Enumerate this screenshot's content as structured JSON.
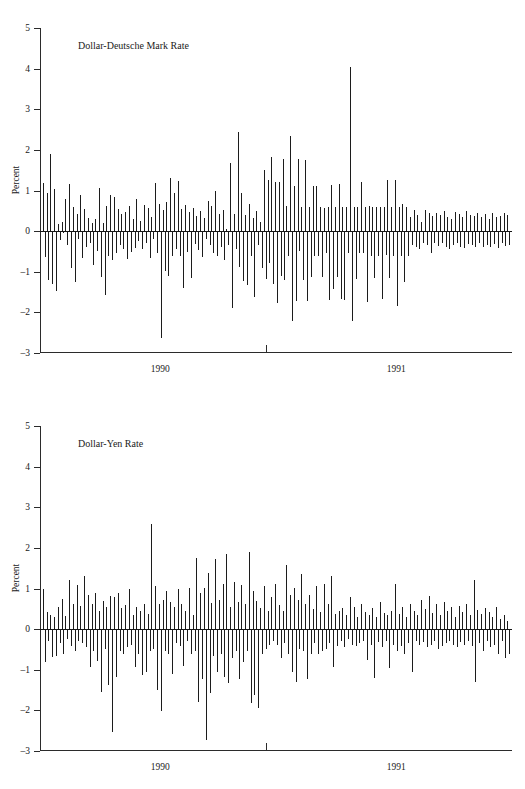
{
  "figure": {
    "width": 525,
    "height": 789,
    "background": "#ffffff",
    "ink_color": "#1c1c1c"
  },
  "chart_data": [
    {
      "type": "bar",
      "subtype": "spike",
      "title": "Dollar-Deutsche Mark Rate",
      "xlabel": "",
      "ylabel": "Percent",
      "ylim": [
        -3,
        5
      ],
      "yticks": [
        5,
        4,
        3,
        2,
        1,
        0,
        -1,
        -2,
        -3
      ],
      "ytick_labels": [
        "5",
        "4",
        "3",
        "2",
        "1",
        "0",
        "–1",
        "–2",
        "–3"
      ],
      "xtick_labels": [
        "1990",
        "1991"
      ],
      "xtick_label_positions": [
        0.255,
        0.755
      ],
      "xtick_marks": [
        0.4788
      ],
      "grid": false,
      "legend": null,
      "zero_line": true,
      "n_points": 250,
      "values": [
        1.19,
        -0.63,
        0.93,
        -1.21,
        1.89,
        -1.31,
        1.03,
        -1.48,
        0.18,
        -0.22,
        0.23,
        -0.05,
        0.78,
        -0.35,
        1.17,
        -0.9,
        0.6,
        -1.25,
        0.42,
        -0.2,
        0.9,
        -0.67,
        0.55,
        -0.4,
        0.33,
        -0.28,
        0.2,
        -0.83,
        0.31,
        -0.5,
        1.05,
        -1.12,
        0.2,
        -1.56,
        0.62,
        -0.62,
        0.88,
        -0.72,
        0.85,
        -0.55,
        0.55,
        -0.35,
        0.41,
        -0.43,
        0.48,
        -0.68,
        0.62,
        -0.52,
        0.3,
        -0.42,
        0.78,
        -0.24,
        0.25,
        -0.44,
        0.65,
        -0.3,
        0.58,
        -0.67,
        0.35,
        -0.2,
        1.19,
        -0.55,
        0.68,
        -2.62,
        0.52,
        -0.98,
        0.72,
        -1.1,
        1.3,
        -0.6,
        0.95,
        -0.43,
        1.24,
        -0.6,
        0.55,
        -1.4,
        0.65,
        -0.52,
        0.46,
        -1.16,
        0.58,
        -0.32,
        0.37,
        -0.46,
        0.5,
        -0.63,
        0.32,
        -0.2,
        0.75,
        -0.35,
        0.62,
        -0.53,
        1.0,
        -0.62,
        0.43,
        -0.38,
        0.52,
        -0.72,
        0.06,
        -0.33,
        1.67,
        -1.9,
        0.42,
        -0.45,
        2.43,
        -0.88,
        0.94,
        -1.22,
        0.4,
        -1.32,
        0.67,
        -0.6,
        0.33,
        -1.62,
        0.5,
        -0.35,
        0.22,
        -0.9,
        1.5,
        -1.18,
        1.27,
        -0.78,
        1.82,
        -1.3,
        1.2,
        -1.78,
        1.22,
        -1.1,
        1.78,
        -1.2,
        0.62,
        -0.6,
        2.35,
        -2.2,
        1.12,
        -1.72,
        1.78,
        -0.5,
        0.6,
        -1.2,
        1.75,
        -1.72,
        0.6,
        -1.13,
        1.1,
        -0.62,
        1.12,
        -0.6,
        0.6,
        -1.12,
        0.56,
        -0.55,
        0.6,
        -1.7,
        1.13,
        -1.42,
        0.6,
        -1.12,
        1.15,
        -1.68,
        0.6,
        -1.7,
        0.6,
        -0.55,
        4.05,
        -2.2,
        0.6,
        -1.18,
        0.6,
        -0.55,
        1.22,
        -0.55,
        0.6,
        -1.75,
        0.62,
        -0.6,
        0.6,
        -1.15,
        0.6,
        -0.62,
        0.6,
        -1.68,
        0.6,
        -0.58,
        1.25,
        -1.15,
        0.6,
        -0.62,
        1.26,
        -1.85,
        0.6,
        -0.6,
        0.68,
        -1.25,
        0.6,
        -0.6,
        0.35,
        -0.35,
        0.52,
        -0.4,
        0.4,
        -0.45,
        0.22,
        -0.3,
        0.52,
        -0.35,
        0.45,
        -0.55,
        0.38,
        -0.28,
        0.44,
        -0.36,
        0.4,
        -0.3,
        0.5,
        -0.4,
        0.35,
        -0.45,
        0.3,
        -0.35,
        0.48,
        -0.3,
        0.42,
        -0.38,
        0.35,
        -0.42,
        0.5,
        -0.32,
        0.4,
        -0.35,
        0.38,
        -0.4,
        0.45,
        -0.3,
        0.35,
        -0.38,
        0.42,
        -0.35,
        0.3,
        -0.4,
        0.45,
        -0.32,
        0.36,
        -0.42,
        0.38,
        -0.3,
        0.44,
        -0.36,
        0.4,
        -0.34
      ]
    },
    {
      "type": "bar",
      "subtype": "spike",
      "title": "Dollar-Yen Rate",
      "xlabel": "",
      "ylabel": "Percent",
      "ylim": [
        -3,
        5
      ],
      "yticks": [
        5,
        4,
        3,
        2,
        1,
        0,
        -1,
        -2,
        -3
      ],
      "ytick_labels": [
        "5",
        "4",
        "3",
        "2",
        "1",
        "0",
        "–1",
        "–2",
        "–3"
      ],
      "xtick_labels": [
        "1990",
        "1991"
      ],
      "xtick_label_positions": [
        0.255,
        0.755
      ],
      "xtick_marks": [
        0.4788
      ],
      "grid": false,
      "legend": null,
      "zero_line": true,
      "n_points": 250,
      "values": [
        0.98,
        -0.82,
        0.42,
        -0.3,
        0.35,
        -0.68,
        0.3,
        -0.65,
        0.55,
        -0.35,
        0.75,
        -0.6,
        0.32,
        -0.25,
        1.22,
        -0.42,
        0.62,
        -0.55,
        1.08,
        -0.3,
        0.58,
        -0.35,
        1.3,
        -0.45,
        0.85,
        -0.92,
        0.62,
        -0.55,
        0.9,
        -0.78,
        0.45,
        -1.55,
        0.7,
        -0.48,
        0.55,
        -1.38,
        0.82,
        -2.52,
        0.78,
        -1.18,
        0.9,
        -0.55,
        0.52,
        -0.62,
        0.6,
        -0.45,
        0.98,
        -0.4,
        0.35,
        -0.92,
        0.55,
        -0.62,
        0.45,
        -1.12,
        0.62,
        -1.05,
        0.38,
        -0.55,
        2.6,
        -0.48,
        1.05,
        -1.5,
        0.62,
        -2.02,
        0.72,
        -0.55,
        0.95,
        -0.62,
        0.68,
        -1.1,
        0.55,
        -0.35,
        0.98,
        -0.42,
        0.62,
        -0.9,
        0.45,
        -0.3,
        1.02,
        -0.62,
        0.35,
        -0.55,
        1.75,
        -1.8,
        0.9,
        -1.22,
        1.02,
        -2.72,
        1.38,
        -1.58,
        0.65,
        -0.65,
        1.72,
        -1.05,
        0.72,
        -0.62,
        1.1,
        -1.18,
        1.85,
        -1.32,
        0.55,
        -0.72,
        1.15,
        -0.55,
        0.68,
        -1.22,
        1.08,
        -0.82,
        0.62,
        -0.55,
        1.9,
        -1.82,
        0.95,
        -1.62,
        0.7,
        -1.95,
        0.52,
        -0.62,
        1.05,
        -0.5,
        0.45,
        -0.4,
        0.78,
        -0.28,
        1.12,
        -0.38,
        0.6,
        -0.72,
        0.45,
        -0.35,
        1.58,
        -0.62,
        0.85,
        -1.05,
        1.02,
        -1.3,
        0.72,
        -0.48,
        1.35,
        -0.55,
        0.62,
        -1.22,
        0.85,
        -0.62,
        0.5,
        -0.35,
        1.05,
        -0.62,
        0.42,
        -0.55,
        1.1,
        -0.48,
        0.62,
        -0.35,
        1.3,
        -0.92,
        0.38,
        -0.42,
        0.45,
        -0.3,
        0.52,
        -0.45,
        0.35,
        -0.25,
        0.78,
        -0.38,
        0.55,
        -0.42,
        0.3,
        -0.35,
        0.62,
        -0.28,
        0.42,
        -0.75,
        0.35,
        -0.4,
        0.52,
        -1.2,
        0.3,
        -0.32,
        0.68,
        -0.45,
        0.4,
        -0.3,
        0.35,
        -0.95,
        0.45,
        -0.38,
        1.12,
        -0.55,
        0.38,
        -0.42,
        0.55,
        -0.62,
        0.3,
        -0.35,
        0.62,
        -1.05,
        0.45,
        -0.28,
        0.35,
        -0.4,
        0.72,
        -0.32,
        0.5,
        -0.45,
        0.82,
        -0.38,
        0.4,
        -0.3,
        0.62,
        -0.5,
        0.35,
        -0.42,
        0.68,
        -0.35,
        0.45,
        -0.28,
        0.55,
        -0.4,
        0.3,
        -0.45,
        0.58,
        -0.32,
        0.42,
        -0.38,
        0.62,
        -0.3,
        0.35,
        -0.42,
        1.2,
        -1.3,
        0.48,
        -0.35,
        0.38,
        -0.55,
        0.52,
        -0.3,
        0.42,
        -0.45,
        0.3,
        -0.38,
        0.55,
        -0.62,
        0.25,
        -0.28,
        0.35,
        -0.72,
        0.2,
        -0.62
      ]
    }
  ]
}
